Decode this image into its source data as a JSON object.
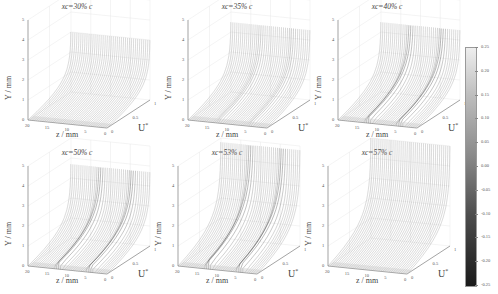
{
  "chart_data": {
    "type": "3d-waterfall",
    "layout": "2x3 grid",
    "shared_colorbar": {
      "position": "right",
      "colormap": "grayscale (light=high, dark=low)",
      "range": [
        -0.25,
        0.25
      ],
      "ticks": [
        "0.25",
        "0.20",
        "0.15",
        "0.10",
        "0.05",
        "0.00",
        "-0.05",
        "-0.10",
        "-0.15",
        "-0.20",
        "-0.25"
      ]
    },
    "axes": {
      "xlabel": "z / mm",
      "ylabel": "Y / mm",
      "ulabel": "U*",
      "z_ticks": [
        "20",
        "15",
        "10",
        "5",
        "0"
      ],
      "y_ticks": [
        "0",
        "1",
        "2",
        "3",
        "4",
        "5"
      ],
      "u_ticks": [
        "0",
        "0.5",
        "1"
      ],
      "grid": true
    },
    "panels": [
      {
        "title": "xc=30% c",
        "profile_height_mm": 3.0,
        "streaks": 0,
        "description": "smooth boundary layer, slight distortion"
      },
      {
        "title": "xc=35% c",
        "profile_height_mm": 3.5,
        "streaks": 2,
        "description": "weak streak distortion near z≈12 and z≈4"
      },
      {
        "title": "xc=40% c",
        "profile_height_mm": 3.5,
        "streaks": 2,
        "description": "two distinct streaks at z≈13 and z≈5"
      },
      {
        "title": "xc=50% c",
        "profile_height_mm": 3.7,
        "streaks": 2,
        "description": "strong streaks at z≈12 and z≈6"
      },
      {
        "title": "xc=53% c",
        "profile_height_mm": 4.8,
        "streaks": 2,
        "description": "streaks broadening with distortion"
      },
      {
        "title": "xc=57% c",
        "profile_height_mm": 5.0,
        "streaks": 0,
        "description": "thickened layer, streaks merged"
      }
    ]
  },
  "panels": [
    {
      "title": "xc=30% c"
    },
    {
      "title": "xc=35% c"
    },
    {
      "title": "xc=40% c"
    },
    {
      "title": "xc=50% c"
    },
    {
      "title": "xc=53% c"
    },
    {
      "title": "xc=57% c"
    }
  ],
  "labels": {
    "y": "Y / mm",
    "z": "z / mm",
    "u": "U",
    "u_sup": "*"
  },
  "ticks": {
    "y": [
      "0",
      "1",
      "2",
      "3",
      "4",
      "5"
    ],
    "z": [
      "20",
      "15",
      "10",
      "5",
      "0"
    ],
    "u": [
      "0",
      "0.5",
      "1"
    ]
  },
  "colorbar": {
    "ticks": [
      "0.25",
      "0.20",
      "0.15",
      "0.10",
      "0.05",
      "0.00",
      "-0.05",
      "-0.10",
      "-0.15",
      "-0.20",
      "-0.25"
    ]
  }
}
